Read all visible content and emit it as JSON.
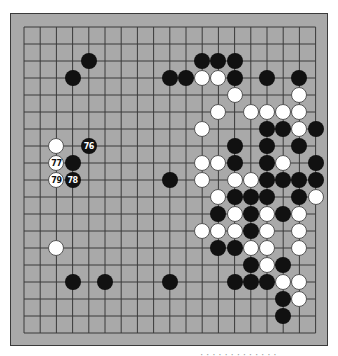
{
  "board": {
    "size": 19,
    "colors": {
      "board_bg": "#a9a9a9",
      "grid_line": "#3a3a3a",
      "black_stone": "#111111",
      "white_stone": "#ffffff"
    },
    "grid_origin_px": [
      23,
      26
    ],
    "col_spacing_px": 16.2,
    "row_spacing_px": 17.0,
    "stones": [
      {
        "col": 4,
        "row": 2,
        "color": "black"
      },
      {
        "col": 3,
        "row": 3,
        "color": "black"
      },
      {
        "col": 2,
        "row": 7,
        "color": "white"
      },
      {
        "col": 4,
        "row": 7,
        "color": "black",
        "label": "76"
      },
      {
        "col": 2,
        "row": 8,
        "color": "white",
        "label": "77"
      },
      {
        "col": 3,
        "row": 8,
        "color": "black"
      },
      {
        "col": 2,
        "row": 9,
        "color": "white",
        "label": "79"
      },
      {
        "col": 3,
        "row": 9,
        "color": "black",
        "label": "78"
      },
      {
        "col": 2,
        "row": 13,
        "color": "white"
      },
      {
        "col": 3,
        "row": 15,
        "color": "black"
      },
      {
        "col": 5,
        "row": 15,
        "color": "black"
      },
      {
        "col": 9,
        "row": 15,
        "color": "black"
      },
      {
        "col": 9,
        "row": 9,
        "color": "black"
      },
      {
        "col": 11,
        "row": 2,
        "color": "black"
      },
      {
        "col": 12,
        "row": 2,
        "color": "black"
      },
      {
        "col": 13,
        "row": 2,
        "color": "black"
      },
      {
        "col": 9,
        "row": 3,
        "color": "black"
      },
      {
        "col": 10,
        "row": 3,
        "color": "black"
      },
      {
        "col": 11,
        "row": 3,
        "color": "white"
      },
      {
        "col": 12,
        "row": 3,
        "color": "white"
      },
      {
        "col": 13,
        "row": 3,
        "color": "black"
      },
      {
        "col": 15,
        "row": 3,
        "color": "black"
      },
      {
        "col": 17,
        "row": 3,
        "color": "black"
      },
      {
        "col": 13,
        "row": 4,
        "color": "white"
      },
      {
        "col": 17,
        "row": 4,
        "color": "white"
      },
      {
        "col": 12,
        "row": 5,
        "color": "white"
      },
      {
        "col": 14,
        "row": 5,
        "color": "white"
      },
      {
        "col": 15,
        "row": 5,
        "color": "white"
      },
      {
        "col": 16,
        "row": 5,
        "color": "white"
      },
      {
        "col": 17,
        "row": 5,
        "color": "white"
      },
      {
        "col": 11,
        "row": 6,
        "color": "white"
      },
      {
        "col": 15,
        "row": 6,
        "color": "black"
      },
      {
        "col": 16,
        "row": 6,
        "color": "black"
      },
      {
        "col": 17,
        "row": 6,
        "color": "white"
      },
      {
        "col": 18,
        "row": 6,
        "color": "black"
      },
      {
        "col": 13,
        "row": 7,
        "color": "black"
      },
      {
        "col": 15,
        "row": 7,
        "color": "black"
      },
      {
        "col": 17,
        "row": 7,
        "color": "black"
      },
      {
        "col": 11,
        "row": 8,
        "color": "white"
      },
      {
        "col": 12,
        "row": 8,
        "color": "white"
      },
      {
        "col": 13,
        "row": 8,
        "color": "black"
      },
      {
        "col": 15,
        "row": 8,
        "color": "black"
      },
      {
        "col": 16,
        "row": 8,
        "color": "white"
      },
      {
        "col": 18,
        "row": 8,
        "color": "black"
      },
      {
        "col": 11,
        "row": 9,
        "color": "white"
      },
      {
        "col": 13,
        "row": 9,
        "color": "white"
      },
      {
        "col": 14,
        "row": 9,
        "color": "white"
      },
      {
        "col": 15,
        "row": 9,
        "color": "black"
      },
      {
        "col": 16,
        "row": 9,
        "color": "black"
      },
      {
        "col": 17,
        "row": 9,
        "color": "black"
      },
      {
        "col": 18,
        "row": 9,
        "color": "black"
      },
      {
        "col": 12,
        "row": 10,
        "color": "white"
      },
      {
        "col": 13,
        "row": 10,
        "color": "black"
      },
      {
        "col": 14,
        "row": 10,
        "color": "black"
      },
      {
        "col": 15,
        "row": 10,
        "color": "black"
      },
      {
        "col": 17,
        "row": 10,
        "color": "black"
      },
      {
        "col": 18,
        "row": 10,
        "color": "white"
      },
      {
        "col": 12,
        "row": 11,
        "color": "black"
      },
      {
        "col": 13,
        "row": 11,
        "color": "white"
      },
      {
        "col": 14,
        "row": 11,
        "color": "black"
      },
      {
        "col": 15,
        "row": 11,
        "color": "white"
      },
      {
        "col": 16,
        "row": 11,
        "color": "black"
      },
      {
        "col": 17,
        "row": 11,
        "color": "white"
      },
      {
        "col": 11,
        "row": 12,
        "color": "white"
      },
      {
        "col": 12,
        "row": 12,
        "color": "white"
      },
      {
        "col": 13,
        "row": 12,
        "color": "white"
      },
      {
        "col": 14,
        "row": 12,
        "color": "black"
      },
      {
        "col": 15,
        "row": 12,
        "color": "white"
      },
      {
        "col": 17,
        "row": 12,
        "color": "white"
      },
      {
        "col": 12,
        "row": 13,
        "color": "black"
      },
      {
        "col": 13,
        "row": 13,
        "color": "black"
      },
      {
        "col": 14,
        "row": 13,
        "color": "white"
      },
      {
        "col": 15,
        "row": 13,
        "color": "white"
      },
      {
        "col": 17,
        "row": 13,
        "color": "white"
      },
      {
        "col": 14,
        "row": 14,
        "color": "black"
      },
      {
        "col": 15,
        "row": 14,
        "color": "white"
      },
      {
        "col": 16,
        "row": 14,
        "color": "black"
      },
      {
        "col": 13,
        "row": 15,
        "color": "black"
      },
      {
        "col": 14,
        "row": 15,
        "color": "black"
      },
      {
        "col": 15,
        "row": 15,
        "color": "black"
      },
      {
        "col": 16,
        "row": 15,
        "color": "white"
      },
      {
        "col": 17,
        "row": 15,
        "color": "white"
      },
      {
        "col": 16,
        "row": 16,
        "color": "black"
      },
      {
        "col": 17,
        "row": 16,
        "color": "white"
      },
      {
        "col": 16,
        "row": 17,
        "color": "black"
      }
    ]
  },
  "caption": {
    "text": "· · · ·  · ·   · · · · · · ·"
  }
}
